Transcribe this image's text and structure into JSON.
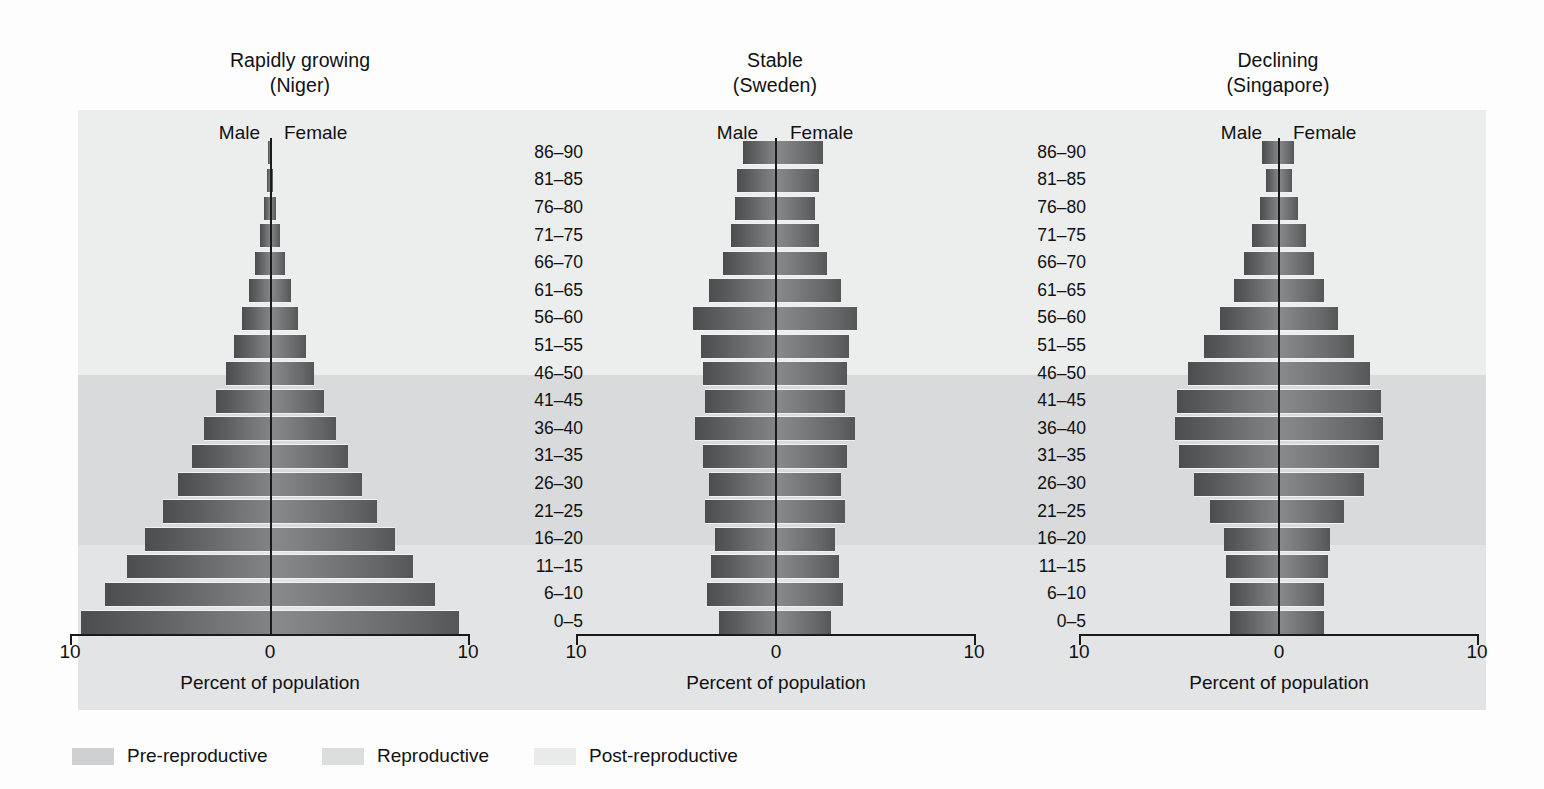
{
  "figure": {
    "xlabel": "Percent of population",
    "axis_ticks": [
      "10",
      "0",
      "10"
    ],
    "male_label": "Male",
    "female_label": "Female"
  },
  "age_groups": [
    "86–90",
    "81–85",
    "76–80",
    "71–75",
    "66–70",
    "61–65",
    "56–60",
    "51–55",
    "46–50",
    "41–45",
    "36–40",
    "31–35",
    "26–30",
    "21–25",
    "16–20",
    "11–15",
    "6–10",
    "0–5"
  ],
  "legend": {
    "items": [
      {
        "label": "Pre-reproductive",
        "color": "#cfd0d1"
      },
      {
        "label": "Reproductive",
        "color": "#dcdddd"
      },
      {
        "label": "Post-reproductive",
        "color": "#e9eaea"
      }
    ]
  },
  "bands": {
    "post_reproductive_ages": [
      "51–55",
      "56–60",
      "61–65",
      "66–70",
      "71–75",
      "76–80",
      "81–85",
      "86–90"
    ],
    "reproductive_ages": [
      "16–20",
      "21–25",
      "26–30",
      "31–35",
      "36–40",
      "41–45",
      "46–50"
    ],
    "pre_reproductive_ages": [
      "0–5",
      "6–10",
      "11–15"
    ]
  },
  "panels": [
    {
      "id": "niger",
      "title_line1": "Rapidly growing",
      "title_line2": "(Niger)"
    },
    {
      "id": "sweden",
      "title_line1": "Stable",
      "title_line2": "(Sweden)"
    },
    {
      "id": "singapore",
      "title_line1": "Declining",
      "title_line2": "(Singapore)"
    }
  ],
  "chart_data": {
    "type": "bar",
    "subtype": "population-pyramid",
    "xlabel": "Percent of population",
    "ylabel": "Age group (years)",
    "xlim": [
      -10,
      10
    ],
    "xticks": [
      10,
      0,
      10
    ],
    "grid": false,
    "legend_position": "bottom-left",
    "categories": [
      "0–5",
      "6–10",
      "11–15",
      "16–20",
      "21–25",
      "26–30",
      "31–35",
      "36–40",
      "41–45",
      "46–50",
      "51–55",
      "56–60",
      "61–65",
      "66–70",
      "71–75",
      "76–80",
      "81–85",
      "86–90"
    ],
    "panels": [
      {
        "name": "Rapidly growing (Niger)",
        "series": [
          {
            "name": "Male",
            "values": [
              9.5,
              8.3,
              7.2,
              6.3,
              5.4,
              4.6,
              3.9,
              3.3,
              2.7,
              2.2,
              1.8,
              1.4,
              1.05,
              0.75,
              0.5,
              0.3,
              0.16,
              0.08
            ]
          },
          {
            "name": "Female",
            "values": [
              9.5,
              8.3,
              7.2,
              6.3,
              5.4,
              4.6,
              3.9,
              3.3,
              2.7,
              2.2,
              1.8,
              1.4,
              1.05,
              0.75,
              0.5,
              0.3,
              0.16,
              0.08
            ]
          }
        ]
      },
      {
        "name": "Stable (Sweden)",
        "series": [
          {
            "name": "Male",
            "values": [
              2.8,
              3.4,
              3.2,
              3.0,
              3.5,
              3.3,
              3.6,
              4.0,
              3.5,
              3.6,
              3.7,
              4.1,
              3.3,
              2.6,
              2.2,
              2.0,
              1.9,
              1.6
            ]
          },
          {
            "name": "Female",
            "values": [
              2.8,
              3.4,
              3.2,
              3.0,
              3.5,
              3.3,
              3.6,
              4.0,
              3.5,
              3.6,
              3.7,
              4.1,
              3.3,
              2.6,
              2.2,
              2.0,
              2.2,
              2.4
            ]
          }
        ]
      },
      {
        "name": "Declining (Singapore)",
        "series": [
          {
            "name": "Male",
            "values": [
              2.4,
              2.4,
              2.6,
              2.7,
              3.4,
              4.2,
              5.0,
              5.2,
              5.1,
              4.5,
              3.7,
              2.9,
              2.2,
              1.7,
              1.3,
              0.9,
              0.6,
              0.8
            ]
          },
          {
            "name": "Female",
            "values": [
              2.3,
              2.3,
              2.5,
              2.6,
              3.3,
              4.3,
              5.1,
              5.3,
              5.2,
              4.6,
              3.8,
              3.0,
              2.3,
              1.8,
              1.4,
              1.0,
              0.7,
              0.8
            ]
          }
        ]
      }
    ]
  }
}
